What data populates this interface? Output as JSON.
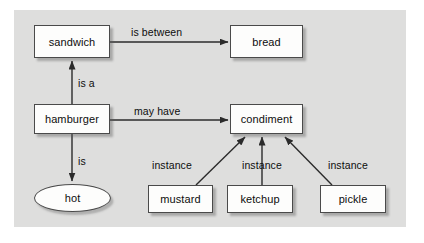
{
  "diagram": {
    "background_color": "#dededd",
    "node_fill": "#fdfdfc",
    "node_stroke": "#4a4a4a",
    "text_color": "#0d0d0d",
    "nodes": [
      {
        "id": "sandwich",
        "label": "sandwich",
        "shape": "rect",
        "x": 34,
        "y": 25,
        "w": 76,
        "h": 33
      },
      {
        "id": "bread",
        "label": "bread",
        "shape": "rect",
        "x": 230,
        "y": 25,
        "w": 73,
        "h": 33
      },
      {
        "id": "hamburger",
        "label": "hamburger",
        "shape": "rect",
        "x": 34,
        "y": 104,
        "w": 76,
        "h": 30
      },
      {
        "id": "condiment",
        "label": "condiment",
        "shape": "rect",
        "x": 230,
        "y": 104,
        "w": 73,
        "h": 30
      },
      {
        "id": "hot",
        "label": "hot",
        "shape": "ellipse",
        "x": 34,
        "y": 184,
        "w": 77,
        "h": 28
      },
      {
        "id": "mustard",
        "label": "mustard",
        "shape": "rect",
        "x": 148,
        "y": 185,
        "w": 65,
        "h": 28
      },
      {
        "id": "ketchup",
        "label": "ketchup",
        "shape": "rect",
        "x": 227,
        "y": 185,
        "w": 66,
        "h": 28
      },
      {
        "id": "pickle",
        "label": "pickle",
        "shape": "rect",
        "x": 320,
        "y": 185,
        "w": 66,
        "h": 28
      }
    ],
    "edges": [
      {
        "id": "sandwich-bread",
        "from": "sandwich",
        "to": "bread",
        "label": "is between",
        "label_x": 131,
        "label_y": 26
      },
      {
        "id": "hamburger-sandwich",
        "from": "hamburger",
        "to": "sandwich",
        "label": "is a",
        "label_x": 78,
        "label_y": 77
      },
      {
        "id": "hamburger-condiment",
        "from": "hamburger",
        "to": "condiment",
        "label": "may have",
        "label_x": 134,
        "label_y": 105
      },
      {
        "id": "hamburger-hot",
        "from": "hamburger",
        "to": "hot",
        "label": "is",
        "label_x": 78,
        "label_y": 155
      },
      {
        "id": "mustard-condiment",
        "from": "mustard",
        "to": "condiment",
        "label": "instance",
        "label_x": 152,
        "label_y": 159
      },
      {
        "id": "ketchup-condiment",
        "from": "ketchup",
        "to": "condiment",
        "label": "instance",
        "label_x": 242,
        "label_y": 159
      },
      {
        "id": "pickle-condiment",
        "from": "pickle",
        "to": "condiment",
        "label": "instance",
        "label_x": 328,
        "label_y": 159
      }
    ]
  }
}
